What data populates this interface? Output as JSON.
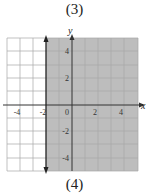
{
  "top_label": "(3)",
  "bottom_label": "(4)",
  "graph": {
    "x_axis_label": "x",
    "y_axis_label": "y",
    "x_ticks": [
      "-4",
      "-2",
      "0",
      "2",
      "4"
    ],
    "y_ticks": [
      "4",
      "2",
      "-2",
      "-4"
    ],
    "boundary_line": "x = -2",
    "shaded_region": "x > -2",
    "shade_color": "#b8b8b8",
    "grid_color": "#a0a0a0"
  }
}
